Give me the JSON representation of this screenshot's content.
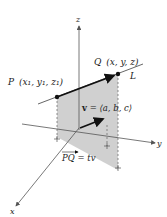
{
  "diagram": {
    "axes": {
      "x_label": "x",
      "y_label": "y",
      "z_label": "z"
    },
    "points": {
      "P": {
        "label": "P",
        "coords": "(x₁, y₁, z₁)"
      },
      "Q": {
        "label": "Q",
        "coords": "(x, y, z)"
      }
    },
    "line_label": "L",
    "vector_label_v": "v",
    "vector_label_rest": " = ⟨a, b, c⟩",
    "pq_label": "PQ",
    "pq_rest": " = tv",
    "colors": {
      "shade": "#c8c8c8",
      "line": "#111111",
      "axis": "#555555"
    }
  }
}
